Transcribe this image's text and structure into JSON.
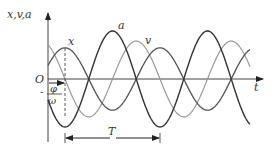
{
  "figure": {
    "title": "",
    "y_axis_label": "x,v,a",
    "x_axis_label": "t",
    "origin_label": "O",
    "phase_label_numerator": "φ",
    "phase_label_denominator": "ω",
    "phase_label_sign": "-",
    "period_label": "T",
    "curve_labels": {
      "x": "x",
      "v": "v",
      "a": "a"
    }
  },
  "chart_data": {
    "type": "line",
    "title": "",
    "xlabel": "t",
    "ylabel": "x,v,a",
    "grid": false,
    "legend": "inline labels",
    "period_px": 95,
    "series": [
      {
        "name": "x",
        "amplitude_rel": 0.65,
        "phase_peak_px": 65,
        "form": "A cos(ωt + φ)"
      },
      {
        "name": "v",
        "amplitude_rel": 0.79,
        "phase_peak_px": 41.25,
        "form": "Aω cos(ωt + φ + π/2)"
      },
      {
        "name": "a",
        "amplitude_rel": 1.0,
        "phase_peak_px": 112.5,
        "form": "Aω² cos(ωt + φ + π)"
      }
    ],
    "annotations": [
      "O",
      "φ/ω",
      "T"
    ]
  }
}
